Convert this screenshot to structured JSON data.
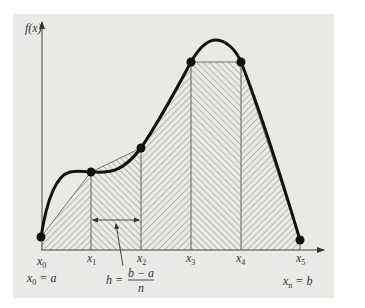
{
  "figure": {
    "y_axis_label": "f(x)",
    "x_ticks": [
      {
        "main": "x",
        "sub": "0"
      },
      {
        "main": "x",
        "sub": "1"
      },
      {
        "main": "x",
        "sub": "2"
      },
      {
        "main": "x",
        "sub": "3"
      },
      {
        "main": "x",
        "sub": "4"
      },
      {
        "main": "x",
        "sub": "5"
      }
    ],
    "left_bound": {
      "main": "x",
      "sub": "0",
      "rhs": "= a"
    },
    "right_bound": {
      "main": "x",
      "sub": "n",
      "rhs": "= b"
    },
    "step_formula": {
      "lhs": "h =",
      "numerator": "b − a",
      "denominator": "n"
    },
    "colors": {
      "background": "#e9e9e7",
      "curve": "#111111",
      "hatch": "#8a8a8a",
      "axis": "#444444"
    }
  }
}
